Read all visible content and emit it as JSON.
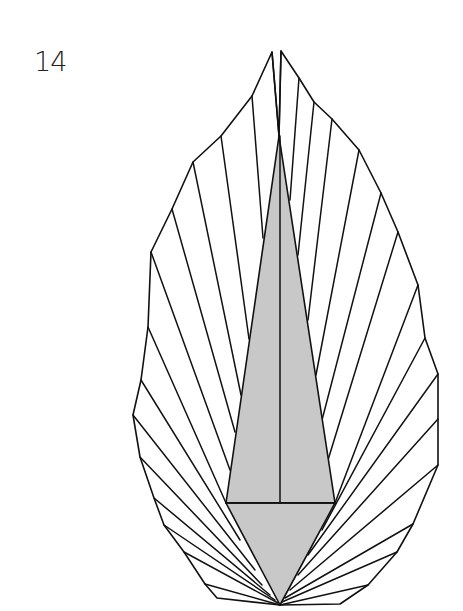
{
  "step": {
    "number": "14"
  },
  "colors": {
    "line": "#111111",
    "shaded": "#c8c8c8",
    "paper": "#ffffff"
  },
  "diagram": {
    "outline": [
      [
        272,
        52
      ],
      [
        252,
        96
      ],
      [
        221,
        136
      ],
      [
        193,
        162
      ],
      [
        172,
        209
      ],
      [
        151,
        252
      ],
      [
        148,
        327
      ],
      [
        141,
        380
      ],
      [
        133,
        415
      ],
      [
        140,
        457
      ],
      [
        154,
        498
      ],
      [
        164,
        525
      ],
      [
        184,
        552
      ],
      [
        205,
        584
      ],
      [
        217,
        598
      ],
      [
        280,
        605
      ],
      [
        340,
        604
      ],
      [
        368,
        585
      ],
      [
        397,
        552
      ],
      [
        413,
        524
      ],
      [
        438,
        465
      ],
      [
        438,
        419
      ],
      [
        438,
        374
      ],
      [
        425,
        338
      ],
      [
        418,
        285
      ],
      [
        398,
        232
      ],
      [
        381,
        193
      ],
      [
        359,
        150
      ],
      [
        332,
        119
      ],
      [
        314,
        102
      ],
      [
        299,
        78
      ],
      [
        281,
        51
      ],
      [
        279,
        136
      ]
    ],
    "shaded_upper": [
      [
        279,
        136
      ],
      [
        226,
        503
      ],
      [
        335,
        503
      ]
    ],
    "shaded_lower": [
      [
        226,
        503
      ],
      [
        335,
        503
      ],
      [
        280,
        605
      ]
    ],
    "center_line": [
      [
        280,
        136
      ],
      [
        280,
        503
      ]
    ],
    "base_line": [
      [
        226,
        503
      ],
      [
        335,
        503
      ]
    ],
    "rays": [
      [
        [
          272,
          52
        ],
        [
          279,
          136
        ]
      ],
      [
        [
          281,
          51
        ],
        [
          279,
          136
        ]
      ],
      [
        [
          252,
          96
        ],
        [
          263,
          238
        ]
      ],
      [
        [
          221,
          136
        ],
        [
          249,
          339
        ]
      ],
      [
        [
          193,
          162
        ],
        [
          241,
          395
        ]
      ],
      [
        [
          172,
          209
        ],
        [
          235,
          432
        ]
      ],
      [
        [
          151,
          252
        ],
        [
          230,
          470
        ]
      ],
      [
        [
          148,
          327
        ],
        [
          226,
          503
        ]
      ],
      [
        [
          141,
          380
        ],
        [
          240,
          540
        ]
      ],
      [
        [
          133,
          415
        ],
        [
          255,
          570
        ]
      ],
      [
        [
          140,
          457
        ],
        [
          262,
          585
        ]
      ],
      [
        [
          154,
          498
        ],
        [
          270,
          595
        ]
      ],
      [
        [
          164,
          525
        ],
        [
          275,
          600
        ]
      ],
      [
        [
          184,
          552
        ],
        [
          278,
          603
        ]
      ],
      [
        [
          205,
          584
        ],
        [
          280,
          605
        ]
      ],
      [
        [
          299,
          78
        ],
        [
          290,
          200
        ]
      ],
      [
        [
          314,
          102
        ],
        [
          298,
          255
        ]
      ],
      [
        [
          332,
          119
        ],
        [
          308,
          320
        ]
      ],
      [
        [
          359,
          150
        ],
        [
          316,
          375
        ]
      ],
      [
        [
          381,
          193
        ],
        [
          322,
          420
        ]
      ],
      [
        [
          398,
          232
        ],
        [
          328,
          460
        ]
      ],
      [
        [
          418,
          285
        ],
        [
          335,
          503
        ]
      ],
      [
        [
          425,
          338
        ],
        [
          322,
          530
        ]
      ],
      [
        [
          438,
          374
        ],
        [
          308,
          555
        ]
      ],
      [
        [
          438,
          419
        ],
        [
          298,
          575
        ]
      ],
      [
        [
          438,
          465
        ],
        [
          290,
          590
        ]
      ],
      [
        [
          413,
          524
        ],
        [
          285,
          598
        ]
      ],
      [
        [
          397,
          552
        ],
        [
          282,
          602
        ]
      ],
      [
        [
          368,
          585
        ],
        [
          280,
          605
        ]
      ]
    ]
  }
}
